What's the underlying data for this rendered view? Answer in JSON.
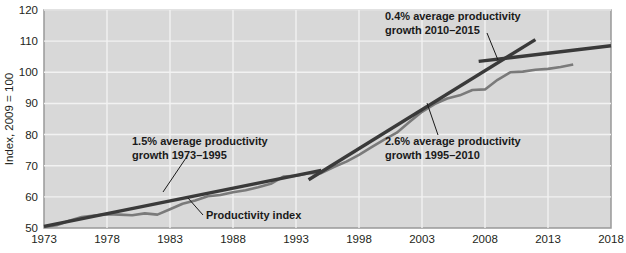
{
  "chart_data": {
    "type": "line",
    "title": "",
    "xlabel": "",
    "ylabel": "Index, 2009 = 100",
    "xlim": [
      1973,
      2018
    ],
    "ylim": [
      50,
      120
    ],
    "yticks": [
      50,
      60,
      70,
      80,
      90,
      100,
      110,
      120
    ],
    "xticks": [
      1973,
      1978,
      1983,
      1988,
      1993,
      1998,
      2003,
      2008,
      2013,
      2018
    ],
    "grid": true,
    "legend_position": "none",
    "plot_background": "#d8d8d8",
    "gridline_color": "#f2f2f2",
    "series": [
      {
        "name": "Productivity index",
        "color": "#7a7a7a",
        "x": [
          1973,
          1974,
          1975,
          1976,
          1977,
          1978,
          1979,
          1980,
          1981,
          1982,
          1983,
          1984,
          1985,
          1986,
          1987,
          1988,
          1989,
          1990,
          1991,
          1992,
          1993,
          1994,
          1995,
          1996,
          1997,
          1998,
          1999,
          2000,
          2001,
          2002,
          2003,
          2004,
          2005,
          2006,
          2007,
          2008,
          2009,
          2010,
          2011,
          2012,
          2013,
          2014,
          2015
        ],
        "values": [
          50.3,
          50.9,
          52.3,
          53.5,
          54.0,
          54.4,
          54.3,
          54.1,
          54.7,
          54.3,
          56.0,
          57.8,
          58.8,
          60.2,
          60.6,
          61.5,
          62.1,
          63.1,
          64.2,
          66.5,
          66.8,
          67.6,
          67.6,
          69.6,
          71.3,
          73.5,
          76.0,
          78.4,
          80.6,
          84.0,
          87.3,
          89.8,
          91.6,
          92.6,
          94.3,
          94.5,
          97.6,
          100.0,
          100.2,
          100.8,
          101.1,
          101.7,
          102.5
        ]
      },
      {
        "name": "1.5% average productivity growth 1973-1995 trend",
        "color": "#3a3a3a",
        "x": [
          1973,
          1995
        ],
        "values": [
          50.5,
          68.5
        ]
      },
      {
        "name": "2.6% average productivity growth 1995-2010 trend",
        "color": "#3a3a3a",
        "x": [
          1994,
          2012
        ],
        "values": [
          65.5,
          110.5
        ]
      },
      {
        "name": "0.4% average productivity growth 2010-2015 trend",
        "color": "#3a3a3a",
        "x": [
          2007.5,
          2018
        ],
        "values": [
          103.5,
          108.5
        ]
      }
    ],
    "annotations": [
      {
        "id": "annot-1973-1995",
        "line1": "1.5% average productivity",
        "line2": "growth 1973–1995",
        "text_x": 132,
        "text_y": 145,
        "leader": [
          [
            188,
            155
          ],
          [
            163,
            192
          ]
        ]
      },
      {
        "id": "annot-2010-2015",
        "line1": "0.4% average productivity",
        "line2": "growth 2010–2015",
        "text_x": 385,
        "text_y": 20,
        "leader": [
          [
            487,
            33
          ],
          [
            498,
            60
          ]
        ]
      },
      {
        "id": "annot-1995-2010",
        "line1": "2.6% average productivity",
        "line2": "growth 1995–2010",
        "text_x": 385,
        "text_y": 145,
        "leader": [
          [
            438,
            135
          ],
          [
            427,
            103
          ]
        ]
      }
    ],
    "series_callout": {
      "id": "series-label-productivity-index",
      "label": "Productivity index",
      "text_x": 206,
      "text_y": 219,
      "leader": [
        [
          203,
          215
        ],
        [
          188,
          198
        ]
      ]
    }
  },
  "axis": {
    "y_label": "Index, 2009 = 100",
    "y_tick_labels": [
      "120",
      "110",
      "100",
      "90",
      "80",
      "70",
      "60",
      "50"
    ],
    "x_tick_labels": [
      "1973",
      "1978",
      "1983",
      "1988",
      "1993",
      "1998",
      "2003",
      "2008",
      "2013",
      "2018"
    ]
  }
}
